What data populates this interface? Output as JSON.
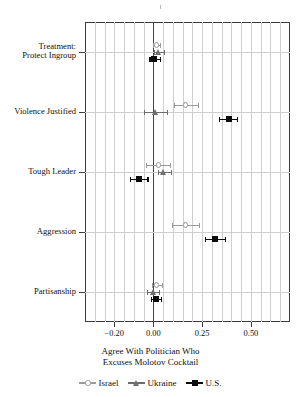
{
  "chart_data": {
    "type": "scatter",
    "title": "",
    "xlabel": "Agree With Politician Who Excuses Molotov Cocktail",
    "xlabel_line1": "Agree With Politician Who",
    "xlabel_line2": "Excuses Molotov Cocktail",
    "ylabel": "",
    "xlim": [
      -0.35,
      0.7
    ],
    "xticks": [
      -0.2,
      0.0,
      0.25,
      0.5
    ],
    "xticklabels": [
      "−0.20",
      "0.00",
      "0.25",
      "0.50"
    ],
    "gridlines_x": [
      -0.3,
      -0.25,
      -0.2,
      -0.15,
      -0.1,
      -0.05,
      0.0,
      0.05,
      0.1,
      0.15,
      0.2,
      0.25,
      0.3,
      0.35,
      0.4,
      0.45,
      0.5,
      0.55,
      0.6,
      0.65
    ],
    "grid": true,
    "legend_position": "below",
    "categories": [
      "Treatment:\nProtect Ingroup",
      "Violence Justified",
      "Tough Leader",
      "Aggression",
      "Partisanship"
    ],
    "category_labels": [
      {
        "line1": "Treatment:",
        "line2": "Protect Ingroup"
      },
      {
        "line1": "Violence Justified",
        "line2": ""
      },
      {
        "line1": "Tough Leader",
        "line2": ""
      },
      {
        "line1": "Aggression",
        "line2": ""
      },
      {
        "line1": "Partisanship",
        "line2": ""
      }
    ],
    "series": [
      {
        "name": "Israel",
        "marker": "circle",
        "color": "#9a9a9a",
        "values": [
          0.015,
          0.165,
          0.025,
          0.165,
          0.015
        ],
        "ci_low": [
          0.0,
          0.105,
          -0.04,
          0.095,
          -0.005
        ],
        "ci_high": [
          0.035,
          0.23,
          0.085,
          0.235,
          0.045
        ]
      },
      {
        "name": "Ukraine",
        "marker": "triangle",
        "color": "#6e6e6e",
        "values": [
          0.025,
          0.01,
          0.055,
          null,
          0.0
        ],
        "ci_low": [
          0.005,
          -0.05,
          0.025,
          null,
          -0.035
        ],
        "ci_high": [
          0.055,
          0.07,
          0.09,
          null,
          0.03
        ]
      },
      {
        "name": "U.S.",
        "marker": "square",
        "color": "#0b0b0b",
        "values": [
          0.005,
          0.385,
          -0.075,
          0.315,
          0.015
        ],
        "ci_low": [
          -0.02,
          0.335,
          -0.12,
          0.265,
          -0.01
        ],
        "ci_high": [
          0.035,
          0.43,
          -0.03,
          0.365,
          0.04
        ]
      }
    ]
  },
  "legend": {
    "items": [
      {
        "label": "Israel",
        "marker": "circle",
        "color": "#9a9a9a"
      },
      {
        "label": "Ukraine",
        "marker": "triangle",
        "color": "#6e6e6e"
      },
      {
        "label": "U.S.",
        "marker": "square",
        "color": "#0b0b0b"
      }
    ]
  }
}
